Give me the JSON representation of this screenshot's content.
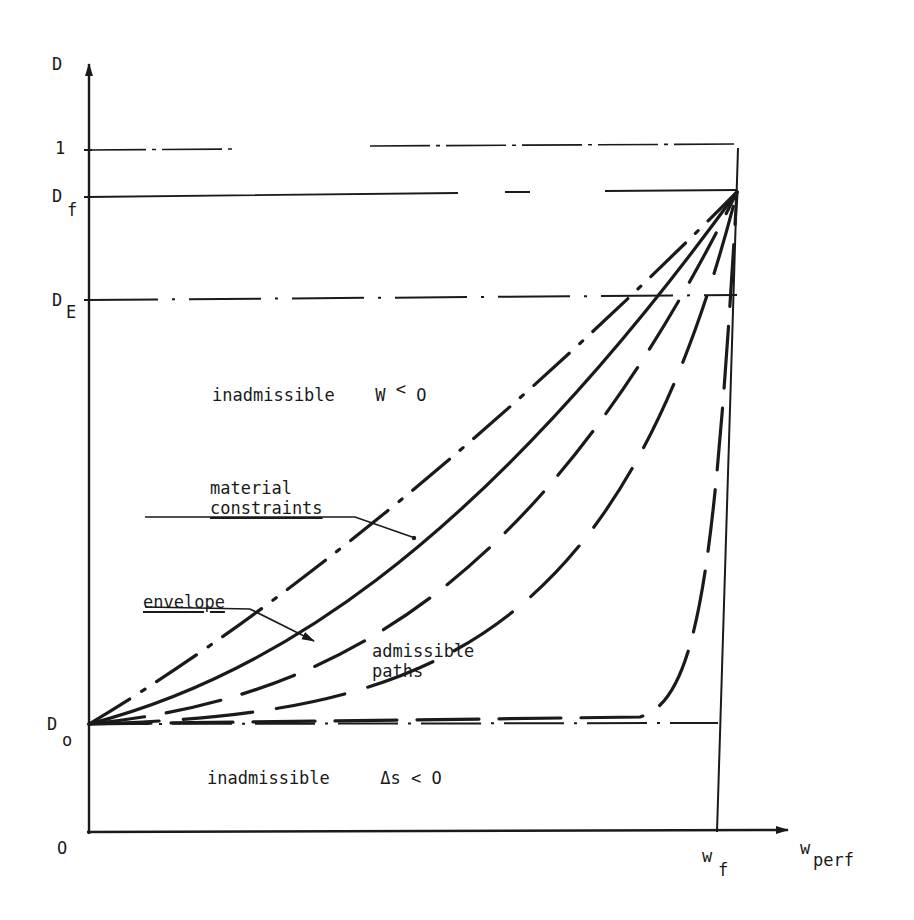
{
  "diagram": {
    "axes": {
      "y_label": "D",
      "x_label_main": "w",
      "x_label_sub": "perf",
      "origin_label": "O"
    },
    "y_ticks": [
      {
        "main": "1",
        "sub": ""
      },
      {
        "main": "D",
        "sub": "f"
      },
      {
        "main": "D",
        "sub": "E"
      },
      {
        "main": "D",
        "sub": "o"
      }
    ],
    "x_ticks": [
      {
        "main": "w",
        "sub": "f"
      }
    ],
    "regions": {
      "upper": "inadmissible  W < O",
      "upper_text": "inadmissible",
      "upper_condition": "W",
      "upper_relation": "<",
      "upper_value": "O",
      "lower_text": "inadmissible",
      "lower_condition": "Δs",
      "lower_relation": "<",
      "lower_value": "O"
    },
    "annotations": {
      "material_line1": "material",
      "material_line2": "constraints",
      "envelope": "envelope",
      "admissible_line1": "admissible",
      "admissible_line2": "paths"
    },
    "curves": [
      {
        "name": "material-constraints",
        "style": "dash-dot"
      },
      {
        "name": "envelope",
        "style": "solid"
      },
      {
        "name": "admissible-path-1",
        "style": "dashed"
      },
      {
        "name": "admissible-path-2",
        "style": "dashed"
      },
      {
        "name": "admissible-path-3",
        "style": "dashed"
      }
    ],
    "stroke_color": "#1a1a1a"
  }
}
